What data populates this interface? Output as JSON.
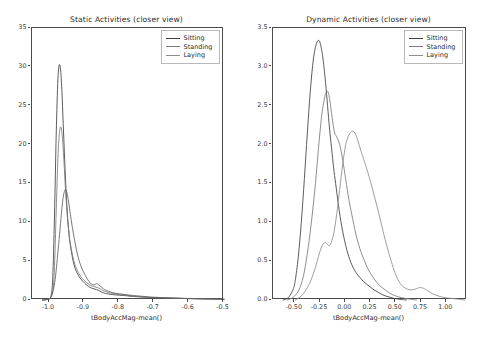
{
  "figure": {
    "width": 481,
    "height": 345,
    "background": "#ffffff",
    "axes_color": "#4a4a4a"
  },
  "chart_data": [
    {
      "id": "static",
      "type": "line",
      "title": "Static Activities (closer view)",
      "xlabel": "tBodyAccMag-mean()",
      "ylabel": "",
      "xlim": [
        -1.05,
        -0.5
      ],
      "ylim": [
        0,
        35
      ],
      "xticks": [
        -1.0,
        -0.9,
        -0.8,
        -0.7,
        -0.6,
        -0.5
      ],
      "xticklabels": [
        "-1.0",
        "-0.9",
        "-0.8",
        "-0.7",
        "-0.6",
        "-0.5"
      ],
      "yticks": [
        0,
        5,
        10,
        15,
        20,
        25,
        30,
        35
      ],
      "yticklabels": [
        "0",
        "5",
        "10",
        "15",
        "20",
        "25",
        "30",
        "35"
      ],
      "grid": false,
      "legend_position": "upper right",
      "series": [
        {
          "name": "Sitting",
          "color": "#3f3f3f",
          "x": [
            -1.02,
            -1.005,
            -0.995,
            -0.99,
            -0.985,
            -0.98,
            -0.975,
            -0.97,
            -0.965,
            -0.96,
            -0.955,
            -0.95,
            -0.945,
            -0.94,
            -0.93,
            -0.92,
            -0.91,
            -0.9,
            -0.89,
            -0.88,
            -0.87,
            -0.86,
            -0.85,
            -0.84,
            -0.82,
            -0.8,
            -0.78,
            -0.76,
            -0.74,
            -0.72,
            -0.7,
            -0.66,
            -0.62,
            -0.58,
            -0.54,
            -0.5
          ],
          "y": [
            0.0,
            0.1,
            0.6,
            3.5,
            12.0,
            22.5,
            29.0,
            30.2,
            27.5,
            22.0,
            16.5,
            12.0,
            9.0,
            7.0,
            4.6,
            3.4,
            2.7,
            2.2,
            1.8,
            1.55,
            1.4,
            1.25,
            1.0,
            0.85,
            0.7,
            0.62,
            0.55,
            0.45,
            0.4,
            0.35,
            0.3,
            0.24,
            0.2,
            0.16,
            0.13,
            0.1
          ]
        },
        {
          "name": "Standing",
          "color": "#7a7a7a",
          "x": [
            -1.02,
            -1.0,
            -0.99,
            -0.985,
            -0.98,
            -0.975,
            -0.97,
            -0.965,
            -0.96,
            -0.955,
            -0.95,
            -0.945,
            -0.94,
            -0.93,
            -0.92,
            -0.91,
            -0.9,
            -0.89,
            -0.88,
            -0.87,
            -0.86,
            -0.85,
            -0.84,
            -0.82,
            -0.8,
            -0.78,
            -0.76,
            -0.74,
            -0.72,
            -0.7,
            -0.66,
            -0.62,
            -0.58,
            -0.54,
            -0.5
          ],
          "x2": [],
          "y": [
            0.0,
            0.2,
            1.2,
            5.0,
            12.5,
            19.0,
            22.0,
            21.8,
            19.0,
            15.0,
            11.5,
            9.0,
            7.2,
            5.0,
            3.8,
            3.0,
            2.5,
            2.1,
            1.85,
            1.7,
            1.55,
            1.3,
            1.1,
            0.85,
            0.7,
            0.6,
            0.5,
            0.42,
            0.36,
            0.3,
            0.24,
            0.2,
            0.16,
            0.13,
            0.1
          ]
        },
        {
          "name": "Laying",
          "color": "#606060",
          "x": [
            -1.02,
            -1.0,
            -0.995,
            -0.985,
            -0.975,
            -0.965,
            -0.96,
            -0.955,
            -0.95,
            -0.945,
            -0.94,
            -0.935,
            -0.93,
            -0.92,
            -0.91,
            -0.9,
            -0.89,
            -0.885,
            -0.88,
            -0.875,
            -0.87,
            -0.865,
            -0.86,
            -0.85,
            -0.84,
            -0.82,
            -0.8,
            -0.78,
            -0.76,
            -0.74,
            -0.72,
            -0.7,
            -0.66,
            -0.62,
            -0.58,
            -0.54,
            -0.5
          ],
          "y": [
            0.0,
            0.15,
            0.5,
            2.2,
            6.5,
            11.5,
            13.4,
            14.2,
            13.8,
            12.6,
            11.0,
            9.5,
            8.2,
            5.9,
            4.4,
            3.4,
            2.6,
            2.3,
            2.05,
            1.95,
            2.0,
            2.1,
            2.0,
            1.6,
            1.3,
            0.95,
            0.8,
            0.68,
            0.58,
            0.5,
            0.42,
            0.36,
            0.28,
            0.22,
            0.18,
            0.14,
            0.1
          ]
        }
      ]
    },
    {
      "id": "dynamic",
      "type": "line",
      "title": "Dynamic Activities (closer view)",
      "xlabel": "tBodyAccMag-mean()",
      "ylabel": "",
      "xlim": [
        -0.72,
        1.2
      ],
      "ylim": [
        0,
        3.5
      ],
      "xticks": [
        -0.5,
        -0.25,
        0.0,
        0.25,
        0.5,
        0.75,
        1.0
      ],
      "xticklabels": [
        "-0.50",
        "-0.25",
        "0.00",
        "0.25",
        "0.50",
        "0.75",
        "1.00"
      ],
      "yticks": [
        0.0,
        0.5,
        1.0,
        1.5,
        2.0,
        2.5,
        3.0,
        3.5
      ],
      "yticklabels": [
        "0.0",
        "0.5",
        "1.0",
        "1.5",
        "2.0",
        "2.5",
        "3.0",
        "3.5"
      ],
      "grid": false,
      "legend_position": "upper right",
      "series": [
        {
          "name": "Sitting",
          "color": "#3f3f3f",
          "x": [
            -0.62,
            -0.58,
            -0.55,
            -0.52,
            -0.5,
            -0.47,
            -0.44,
            -0.41,
            -0.38,
            -0.35,
            -0.32,
            -0.29,
            -0.26,
            -0.23,
            -0.2,
            -0.18,
            -0.16,
            -0.14,
            -0.12,
            -0.1,
            -0.07,
            -0.04,
            0.0,
            0.04,
            0.08,
            0.12,
            0.16,
            0.2,
            0.24,
            0.28,
            0.32,
            0.36,
            0.4,
            0.44,
            0.48,
            0.52,
            0.56,
            0.6
          ],
          "y": [
            0.0,
            0.02,
            0.06,
            0.14,
            0.25,
            0.55,
            1.0,
            1.55,
            2.15,
            2.7,
            3.1,
            3.3,
            3.33,
            3.15,
            2.8,
            2.5,
            2.2,
            1.95,
            1.7,
            1.5,
            1.2,
            0.95,
            0.7,
            0.52,
            0.4,
            0.32,
            0.26,
            0.21,
            0.17,
            0.13,
            0.1,
            0.07,
            0.05,
            0.035,
            0.02,
            0.012,
            0.006,
            0.0
          ]
        },
        {
          "name": "Standing",
          "color": "#7a7a7a",
          "x": [
            -0.58,
            -0.54,
            -0.5,
            -0.46,
            -0.42,
            -0.38,
            -0.34,
            -0.3,
            -0.27,
            -0.24,
            -0.21,
            -0.19,
            -0.17,
            -0.15,
            -0.13,
            -0.11,
            -0.09,
            -0.06,
            -0.03,
            0.0,
            0.03,
            0.06,
            0.1,
            0.14,
            0.18,
            0.22,
            0.26,
            0.3,
            0.34,
            0.38,
            0.42,
            0.46,
            0.5,
            0.55,
            0.6,
            0.65,
            0.7
          ],
          "y": [
            0.0,
            0.02,
            0.06,
            0.14,
            0.3,
            0.6,
            1.0,
            1.5,
            1.95,
            2.35,
            2.6,
            2.68,
            2.66,
            2.5,
            2.3,
            2.15,
            2.1,
            2.0,
            1.8,
            1.55,
            1.3,
            1.1,
            0.85,
            0.66,
            0.52,
            0.4,
            0.31,
            0.24,
            0.18,
            0.14,
            0.1,
            0.07,
            0.05,
            0.03,
            0.018,
            0.008,
            0.0
          ]
        },
        {
          "name": "Laying",
          "color": "#8d8d8d",
          "x": [
            -0.5,
            -0.46,
            -0.42,
            -0.38,
            -0.34,
            -0.3,
            -0.27,
            -0.24,
            -0.21,
            -0.19,
            -0.17,
            -0.15,
            -0.12,
            -0.09,
            -0.06,
            -0.03,
            0.0,
            0.03,
            0.06,
            0.09,
            0.12,
            0.15,
            0.18,
            0.21,
            0.25,
            0.29,
            0.33,
            0.37,
            0.41,
            0.45,
            0.49,
            0.53,
            0.57,
            0.61,
            0.65,
            0.69,
            0.73,
            0.77,
            0.81,
            0.86,
            0.92,
            0.98,
            1.05,
            1.12,
            1.18
          ],
          "y": [
            0.0,
            0.03,
            0.08,
            0.16,
            0.27,
            0.42,
            0.56,
            0.68,
            0.74,
            0.73,
            0.7,
            0.72,
            0.85,
            1.1,
            1.42,
            1.75,
            2.0,
            2.12,
            2.17,
            2.15,
            2.05,
            1.92,
            1.8,
            1.68,
            1.5,
            1.3,
            1.1,
            0.88,
            0.68,
            0.5,
            0.34,
            0.23,
            0.17,
            0.14,
            0.13,
            0.14,
            0.16,
            0.15,
            0.12,
            0.08,
            0.05,
            0.03,
            0.02,
            0.01,
            0.0
          ]
        }
      ]
    }
  ],
  "legend": {
    "entries": [
      {
        "label": "Sitting",
        "color": "#3f3f3f"
      },
      {
        "label": "Standing",
        "color": "#7a7a7a"
      },
      {
        "label": "Laying",
        "color": "#8d8d8d"
      }
    ]
  }
}
